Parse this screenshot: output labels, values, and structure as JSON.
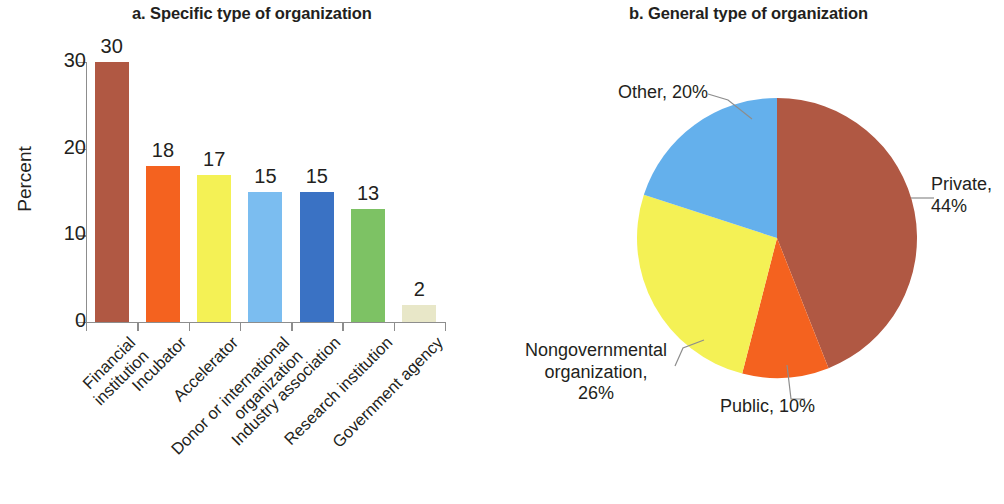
{
  "panel_a": {
    "title": "a. Specific type of organization",
    "y_axis_title": "Percent",
    "y_ticks": [
      0,
      10,
      20,
      30
    ],
    "y_max": 30
  },
  "panel_b": {
    "title": "b. General type of organization"
  },
  "chart_data": [
    {
      "type": "bar",
      "title": "a. Specific type of organization",
      "xlabel": "",
      "ylabel": "Percent",
      "ylim": [
        0,
        30
      ],
      "yticks": [
        0,
        10,
        20,
        30
      ],
      "grid": false,
      "legend": "none",
      "categories": [
        "Financial\ninstitution",
        "Incubator",
        "Accelerator",
        "Donor or international\norganization",
        "Industry association",
        "Research institution",
        "Government agency"
      ],
      "values": [
        30,
        18,
        17,
        15,
        15,
        13,
        2
      ],
      "data_labels": [
        "30",
        "18",
        "17",
        "15",
        "15",
        "13",
        "2"
      ],
      "colors": [
        "#b05843",
        "#f4621f",
        "#f4f155",
        "#7bbdf0",
        "#3a72c4",
        "#7dc264",
        "#e8e7c8"
      ]
    },
    {
      "type": "pie",
      "title": "b. General type of organization",
      "legend": "labels-outside",
      "start_angle_deg": 0,
      "direction": "clockwise",
      "labels": [
        "Private, 44%",
        "Public, 10%",
        "Nongovernmental organization, 26%",
        "Other, 20%"
      ],
      "slices": [
        {
          "name": "Private",
          "value": 44,
          "label_line1": "Private,",
          "label_line2": "44%",
          "color": "#b05843"
        },
        {
          "name": "Public",
          "value": 10,
          "label_line1": "Public, 10%",
          "label_line2": "",
          "color": "#f4621f"
        },
        {
          "name": "Nongovernmental organization",
          "value": 26,
          "label_line1": "Nongovernmental",
          "label_line2": "organization,",
          "label_line3": "26%",
          "color": "#f4f155"
        },
        {
          "name": "Other",
          "value": 20,
          "label_line1": "Other, 20%",
          "label_line2": "",
          "color": "#64b0ec"
        }
      ]
    }
  ],
  "bars": [
    {
      "value_label": "30",
      "label_line1": "Financial",
      "label_line2": "institution"
    },
    {
      "value_label": "18",
      "label_line1": "Incubator",
      "label_line2": ""
    },
    {
      "value_label": "17",
      "label_line1": "Accelerator",
      "label_line2": ""
    },
    {
      "value_label": "15",
      "label_line1": "Donor or international",
      "label_line2": "organization"
    },
    {
      "value_label": "15",
      "label_line1": "Industry association",
      "label_line2": ""
    },
    {
      "value_label": "13",
      "label_line1": "Research institution",
      "label_line2": ""
    },
    {
      "value_label": "2",
      "label_line1": "Government agency",
      "label_line2": ""
    }
  ],
  "y_tick_labels": [
    "30",
    "20",
    "10",
    "0"
  ]
}
